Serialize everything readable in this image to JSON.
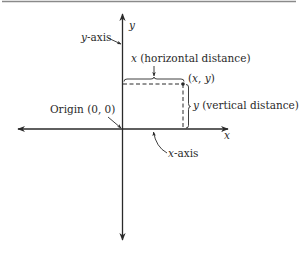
{
  "figure": {
    "colors": {
      "ink": "#2a2a2a",
      "rule": "#8a8a8a",
      "background": "#ffffff"
    }
  },
  "axes": {
    "y_axis_name": "y",
    "x_axis_name": "x",
    "y_axis_label_var": "y",
    "y_axis_label_rest": "-axis",
    "x_axis_label_var": "x",
    "x_axis_label_rest": "-axis"
  },
  "origin": {
    "label": "Origin (0, 0)"
  },
  "point": {
    "label_open": "(",
    "label_x": "x",
    "label_sep": ", ",
    "label_y": "y",
    "label_close": ")"
  },
  "distances": {
    "horizontal_var": "x",
    "horizontal_text": " (horizontal distance)",
    "vertical_var": "y",
    "vertical_text": " (vertical distance)"
  }
}
